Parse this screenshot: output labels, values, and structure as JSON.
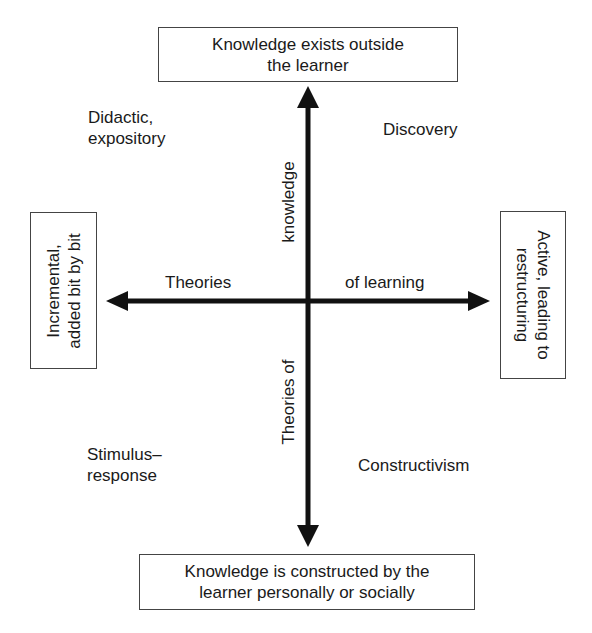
{
  "diagram": {
    "type": "quadrant",
    "axes": {
      "vertical": {
        "top_pole": "Knowledge exists outside the learner",
        "top_pole_lines": [
          "Knowledge exists outside",
          "the learner"
        ],
        "bottom_pole": "Knowledge is constructed by the learner personally or socially",
        "bottom_pole_lines": [
          "Knowledge is constructed by the",
          "learner personally or socially"
        ],
        "upper_label": "knowledge",
        "lower_label": "Theories of",
        "axis_title": "Theories of knowledge"
      },
      "horizontal": {
        "left_pole": "Incremental, added bit by bit",
        "left_pole_lines": [
          "Incremental,",
          "added bit by bit"
        ],
        "right_pole": "Active, leading to restructuring",
        "right_pole_lines": [
          "Active, leading to",
          "restructuring"
        ],
        "left_label": "Theories",
        "right_label": "of learning",
        "axis_title": "Theories of learning"
      }
    },
    "quadrants": {
      "top_left": [
        "Didactic,",
        "expository"
      ],
      "top_right": [
        "Discovery"
      ],
      "bottom_left": [
        "Stimulus–",
        "response"
      ],
      "bottom_right": [
        "Constructivism"
      ]
    },
    "colors": {
      "arrow": "#111111",
      "box_border": "#444444",
      "text": "#1a1a1a",
      "background": "#ffffff"
    }
  }
}
